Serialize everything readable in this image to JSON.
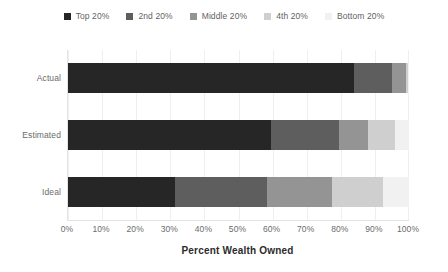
{
  "chart_data": {
    "type": "bar",
    "orientation": "horizontal",
    "stacked": true,
    "title": "",
    "xlabel": "Percent Wealth Owned",
    "ylabel": "",
    "xlim": [
      0,
      100
    ],
    "grid": true,
    "legend_position": "top",
    "categories": [
      "Actual",
      "Estimated",
      "Ideal"
    ],
    "xticks": [
      "0%",
      "10%",
      "20%",
      "30%",
      "40%",
      "50%",
      "60%",
      "70%",
      "80%",
      "90%",
      "100%"
    ],
    "xtick_values": [
      0,
      10,
      20,
      30,
      40,
      50,
      60,
      70,
      80,
      90,
      100
    ],
    "series": [
      {
        "name": "Top 20%",
        "color": "#262626",
        "values": [
          84.0,
          59.5,
          31.5
        ]
      },
      {
        "name": "2nd 20%",
        "color": "#5e5e5e",
        "values": [
          11.0,
          20.0,
          27.0
        ]
      },
      {
        "name": "Middle 20%",
        "color": "#949494",
        "values": [
          4.0,
          8.5,
          19.0
        ]
      },
      {
        "name": "4th 20%",
        "color": "#cfcfcf",
        "values": [
          0.6,
          8.0,
          15.0
        ]
      },
      {
        "name": "Bottom 20%",
        "color": "#f1f1f1",
        "values": [
          0.4,
          4.0,
          7.5
        ]
      }
    ]
  },
  "legend": {
    "items": [
      {
        "label": "Top 20%",
        "color": "#262626"
      },
      {
        "label": "2nd 20%",
        "color": "#5e5e5e"
      },
      {
        "label": "Middle 20%",
        "color": "#949494"
      },
      {
        "label": "4th 20%",
        "color": "#cfcfcf"
      },
      {
        "label": "Bottom 20%",
        "color": "#f1f1f1"
      }
    ]
  },
  "axis": {
    "x_title": "Percent Wealth Owned"
  }
}
